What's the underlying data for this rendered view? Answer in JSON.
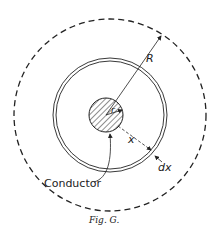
{
  "figure": {
    "caption": "Fig. G.",
    "labels": {
      "outer_radius": "R",
      "conductor_radius": "r",
      "distance": "x",
      "thickness": "dx",
      "conductor": "Conductor"
    },
    "colors": {
      "stroke": "#222222",
      "background": "#ffffff"
    }
  }
}
